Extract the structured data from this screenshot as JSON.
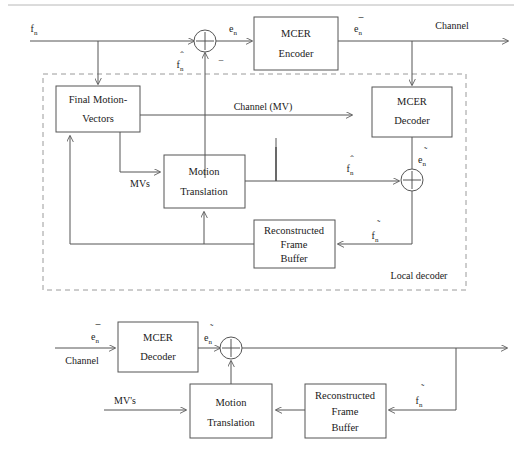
{
  "figure": {
    "type": "block-diagram",
    "top_rule": true,
    "colors": {
      "line": "#555555",
      "dashed_box": "#9a9a9a",
      "text": "#1a1a1a",
      "background": "#ffffff"
    }
  },
  "encoder": {
    "region_label": "Local decoder",
    "blocks": [
      {
        "id": "mcer-encoder",
        "line1": "MCER",
        "line2": "Encoder"
      },
      {
        "id": "final-motion-vectors",
        "line1": "Final Motion-",
        "line2": "Vectors"
      },
      {
        "id": "mcer-decoder-top",
        "line1": "MCER",
        "line2": "Decoder"
      },
      {
        "id": "motion-translation-top",
        "line1": "Motion",
        "line2": "Translation"
      },
      {
        "id": "reconstructed-frame-buffer-top",
        "line1": "Reconstructed",
        "line2": "Frame",
        "line3": "Buffer"
      }
    ],
    "signals": {
      "input_frame": "f",
      "input_frame_sub": "n",
      "error": "e",
      "error_sub": "n",
      "coded_error": "e",
      "coded_error_sub": "n",
      "coded_error_accent": "bar",
      "decoded_error": "e",
      "decoded_error_sub": "n",
      "decoded_error_accent": "tilde",
      "predicted_frame": "f",
      "predicted_frame_sub": "n",
      "predicted_frame_accent": "hat",
      "reconstructed_frame": "f",
      "reconstructed_frame_sub": "n",
      "reconstructed_frame_accent": "tilde",
      "minus_sign": "−",
      "mvs": "MVs",
      "channel_out": "Channel",
      "channel_mv": "Channel (MV)"
    }
  },
  "decoder": {
    "blocks": [
      {
        "id": "mcer-decoder-bottom",
        "line1": "MCER",
        "line2": "Decoder"
      },
      {
        "id": "motion-translation-bottom",
        "line1": "Motion",
        "line2": "Translation"
      },
      {
        "id": "reconstructed-frame-buffer-bottom",
        "line1": "Reconstructed",
        "line2": "Frame",
        "line3": "Buffer"
      }
    ],
    "signals": {
      "channel_in": "Channel",
      "coded_error": "e",
      "coded_error_sub": "n",
      "decoded_error": "e",
      "decoded_error_sub": "n",
      "mvs": "MV's",
      "reconstructed_frame": "f",
      "reconstructed_frame_sub": "n"
    }
  }
}
